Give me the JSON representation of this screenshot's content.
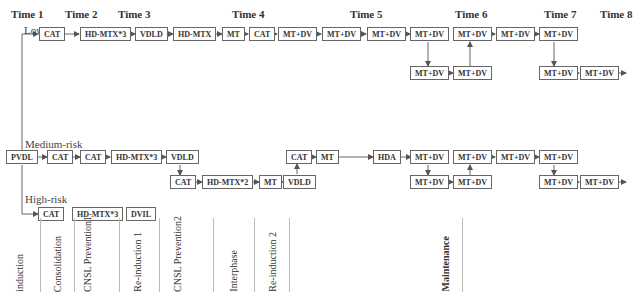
{
  "times": [
    "Time 1",
    "Time 2",
    "Time 3",
    "Time 4",
    "Time 5",
    "Time 6",
    "Time 7",
    "Time 8"
  ],
  "risks": {
    "low": "Low-risk",
    "medium": "Medium-risk",
    "high": "High-risk"
  },
  "nodes": {
    "pvdl": "PVDL",
    "low": [
      "CAT",
      "HD-MTX*3",
      "VDLD",
      "HD-MTX",
      "MT",
      "CAT",
      "MT+DV",
      "MT+DV",
      "MT+DV",
      "MT+DV",
      "MT+DV",
      "MT+DV",
      "MT+DV",
      "MT+DV",
      "MT+DV",
      "MT+DV"
    ],
    "medium": [
      "CAT",
      "CAT",
      "HD-MTX*3",
      "VDLD",
      "CAT",
      "HD-MTX*2",
      "MT",
      "VDLD",
      "CAT",
      "MT",
      "HDA",
      "MT+DV",
      "MT+DV",
      "MT+DV",
      "MT+DV",
      "MT+DV",
      "MT+DV",
      "MT+DV",
      "MT+DV"
    ],
    "high": [
      "CAT",
      "HD-MTX*3",
      "DVIL",
      "DAEL",
      "HD-MTX*3",
      "MT+DV",
      "COAP",
      "MT",
      "DVIL",
      "MT+DV",
      "COAP",
      "MT+DV",
      "DAEL",
      "MT+DV",
      "COAP",
      "MT+DV",
      "DVIL",
      "MT+DV",
      "COAP",
      "MT+DV",
      "DAEL"
    ]
  },
  "phases": [
    "induction",
    "Consolidation",
    "CNSL Prevention1",
    "Re-induction 1",
    "CNSL Prevention2",
    "Interphase",
    "Re-induction 2",
    "Maintenance"
  ],
  "star": "★"
}
